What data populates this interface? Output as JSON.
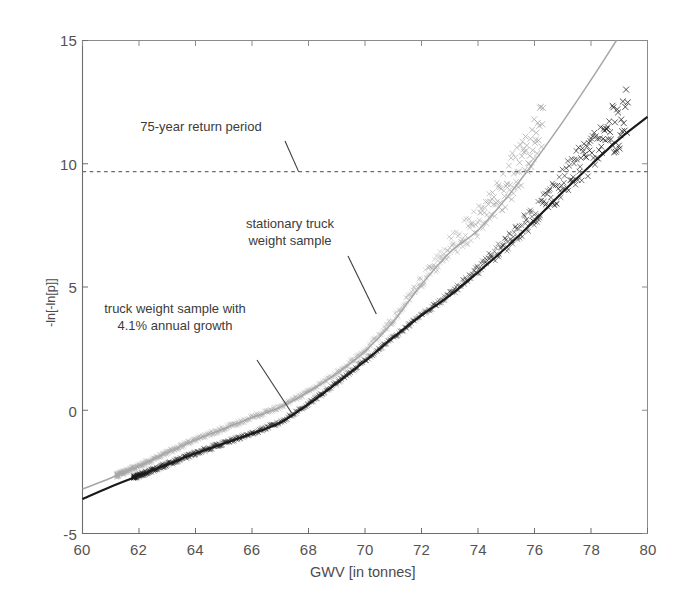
{
  "chart_data": {
    "type": "scatter",
    "title": "",
    "xlabel": "GWV [in tonnes]",
    "ylabel": "-ln[-ln[p]]",
    "xlim": [
      60,
      80
    ],
    "ylim": [
      -5,
      15
    ],
    "xticks": [
      60,
      62,
      64,
      66,
      68,
      70,
      72,
      74,
      76,
      78,
      80
    ],
    "xtick_labels": [
      "60",
      "62",
      "64",
      "66",
      "68",
      "70",
      "72",
      "74",
      "76",
      "78",
      "80"
    ],
    "yticks": [
      -5,
      0,
      5,
      10,
      15
    ],
    "ytick_labels": [
      "-5",
      "0",
      "5",
      "10",
      "15"
    ],
    "grid": false,
    "legend_position": "none",
    "reference_lines": [
      {
        "name": "75-year return period",
        "orientation": "horizontal",
        "value": 9.68,
        "style": "dashed",
        "color": "#6b6b6b"
      }
    ],
    "series": [
      {
        "name": "stationary truck weight sample",
        "color": "#a6a6a6",
        "marker": "x",
        "fit_line": true,
        "description": "Gumbel plot of stationary truck weight sample; fitted curve rises from about -3.2 at 60 t, crosses 0 near 66.9 t, reaches 5 near 71.6 t, crosses the 75-year return level (9.68) near 75.8 t and leaves the top of the frame (15) near 78.9 t.",
        "fit_points": [
          [
            60,
            -3.2
          ],
          [
            61,
            -2.75
          ],
          [
            62,
            -2.25
          ],
          [
            63,
            -1.72
          ],
          [
            64,
            -1.2
          ],
          [
            65,
            -0.75
          ],
          [
            66,
            -0.3
          ],
          [
            67,
            0.12
          ],
          [
            68,
            0.75
          ],
          [
            69,
            1.5
          ],
          [
            70,
            2.4
          ],
          [
            71,
            3.6
          ],
          [
            72,
            5.1
          ],
          [
            73,
            6.4
          ],
          [
            74,
            7.3
          ],
          [
            75,
            8.6
          ],
          [
            76,
            10.1
          ],
          [
            77,
            11.7
          ],
          [
            78,
            13.4
          ],
          [
            78.9,
            15.0
          ]
        ],
        "sample_range": [
          61.2,
          76.3
        ],
        "sample_max": 76.3
      },
      {
        "name": "truck weight sample with 4.1% annual growth",
        "color": "#1a1a1a",
        "marker": "x",
        "fit_line": true,
        "description": "Gumbel plot of truck weight sample with 4.1% annual growth; fitted curve rises from about -3.6 at 60 t, crosses 0 near 67.6 t, reaches 5 near 73.3 t, and reaches about 11.9 at 80 t, crossing the 75-year return level near 78.6 t.",
        "fit_points": [
          [
            60,
            -3.6
          ],
          [
            61,
            -3.1
          ],
          [
            62,
            -2.65
          ],
          [
            63,
            -2.2
          ],
          [
            64,
            -1.75
          ],
          [
            65,
            -1.35
          ],
          [
            66,
            -0.95
          ],
          [
            67,
            -0.5
          ],
          [
            68,
            0.25
          ],
          [
            69,
            1.1
          ],
          [
            70,
            2.0
          ],
          [
            71,
            2.95
          ],
          [
            72,
            3.85
          ],
          [
            73,
            4.65
          ],
          [
            74,
            5.6
          ],
          [
            75,
            6.6
          ],
          [
            76,
            7.7
          ],
          [
            77,
            8.85
          ],
          [
            78,
            9.95
          ],
          [
            79,
            11.0
          ],
          [
            80,
            11.9
          ]
        ],
        "sample_range": [
          61.8,
          79.3
        ],
        "sample_max": 79.3
      }
    ],
    "annotations": [
      {
        "text_lines": [
          "75-year return period"
        ],
        "x": 0.37,
        "y": 10.75,
        "leader_to_x": 67.65,
        "leader_to_y": 9.68
      },
      {
        "text_lines": [
          "stationary truck",
          "weight sample"
        ],
        "x": 0.44,
        "y": 8.2,
        "leader_to_x": 70.4,
        "leader_to_y": 3.9
      },
      {
        "text_lines": [
          "truck weight sample with",
          "4.1% annual growth"
        ],
        "x": 0.27,
        "y": 4.45,
        "leader_to_x": 67.4,
        "leader_to_y": -0.1
      }
    ]
  },
  "axes": {
    "x_title": "GWV [in tonnes]",
    "y_title": "-ln[-ln[p]]",
    "x_tick_labels": [
      "60",
      "62",
      "64",
      "66",
      "68",
      "70",
      "72",
      "74",
      "76",
      "78",
      "80"
    ],
    "y_tick_labels": [
      "15",
      "10",
      "5",
      "0",
      "-5"
    ]
  },
  "annotations": {
    "return_period": "75-year return period",
    "stationary_line1": "stationary truck",
    "stationary_line2": "weight sample",
    "growth_line1": "truck weight sample with",
    "growth_line2": "4.1% annual growth"
  },
  "colors": {
    "stationary_series": "#a6a6a6",
    "growth_series": "#1a1a1a",
    "axis": "#6e6c6c",
    "dashed_reference": "#7a7878",
    "text": "#4a4a4a",
    "background": "#ffffff"
  }
}
